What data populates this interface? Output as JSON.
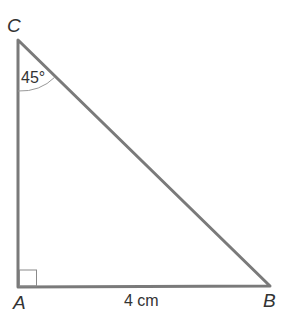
{
  "diagram": {
    "type": "right-triangle",
    "vertices": {
      "A": {
        "label": "A"
      },
      "B": {
        "label": "B"
      },
      "C": {
        "label": "C"
      }
    },
    "angle_C": "45°",
    "side_AB": "4 cm",
    "right_angle_at": "A",
    "line_color": "#7a7a7a"
  }
}
